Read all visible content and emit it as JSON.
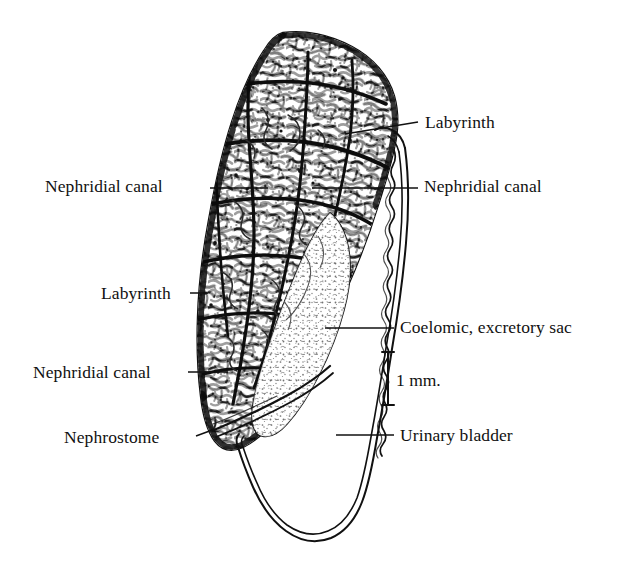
{
  "figure": {
    "kind": "anatomical-line-drawing",
    "background_color": "#ffffff",
    "ink_color": "#111111",
    "width": 639,
    "height": 576
  },
  "labels": [
    {
      "id": "labyrinth-right",
      "text": "Labyrinth",
      "side": "right",
      "text_x": 425,
      "text_y": 114,
      "leader": {
        "x1": 345,
        "y1": 134,
        "x2": 418,
        "y2": 122
      }
    },
    {
      "id": "nephridial-canal-left-upper",
      "text": "Nephridial canal",
      "side": "left",
      "text_x": 45,
      "text_y": 178,
      "leader": {
        "x1": 210,
        "y1": 188,
        "x2": 268,
        "y2": 188
      }
    },
    {
      "id": "nephridial-canal-right",
      "text": "Nephridial canal",
      "side": "right",
      "text_x": 424,
      "text_y": 178,
      "leader": {
        "x1": 312,
        "y1": 188,
        "x2": 418,
        "y2": 188
      }
    },
    {
      "id": "labyrinth-left",
      "text": "Labyrinth",
      "side": "left",
      "text_x": 101,
      "text_y": 285,
      "leader": {
        "x1": 190,
        "y1": 293,
        "x2": 208,
        "y2": 293
      }
    },
    {
      "id": "coelomic-excretory-sac",
      "text": "Coelomic, excretory sac",
      "side": "right",
      "text_x": 400,
      "text_y": 319,
      "leader": {
        "x1": 325,
        "y1": 328,
        "x2": 394,
        "y2": 328
      }
    },
    {
      "id": "nephridial-canal-left-lower",
      "text": "Nephridial canal",
      "side": "left",
      "text_x": 33,
      "text_y": 364,
      "leader": {
        "x1": 188,
        "y1": 372,
        "x2": 228,
        "y2": 372
      }
    },
    {
      "id": "nephrostome",
      "text": "Nephrostome",
      "side": "left",
      "text_x": 64,
      "text_y": 429,
      "leader": {
        "x1": 196,
        "y1": 436,
        "x2": 215,
        "y2": 429
      }
    },
    {
      "id": "urinary-bladder",
      "text": "Urinary bladder",
      "side": "right",
      "text_x": 400,
      "text_y": 427,
      "leader": {
        "x1": 336,
        "y1": 435,
        "x2": 394,
        "y2": 435
      }
    }
  ],
  "scale_bar": {
    "text": "1 mm.",
    "text_x": 396,
    "text_y": 372,
    "bar_x": 388,
    "bar_top": 352,
    "bar_bottom": 405,
    "cap_half_width": 6
  }
}
